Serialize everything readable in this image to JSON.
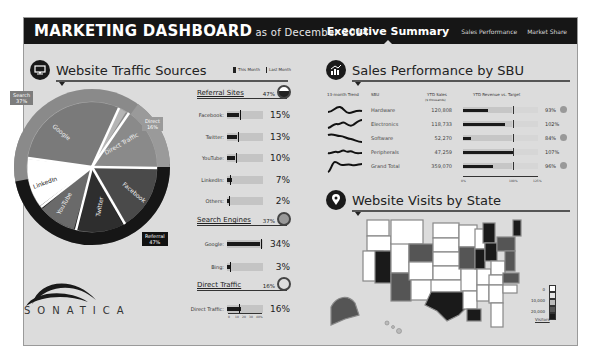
{
  "header": {
    "title": "MARKETING DASHBOARD",
    "subtitle": "as of December 2014",
    "tabs": [
      {
        "label": "Executive Summary",
        "active": true
      },
      {
        "label": "Sales Performance",
        "active": false
      },
      {
        "label": "Market Share",
        "active": false
      }
    ]
  },
  "traffic": {
    "title": "Website Traffic Sources",
    "icon": "monitor-icon",
    "legend": {
      "this_month": "This Month",
      "last_month": "Last Month"
    },
    "pie_labels": {
      "search": "Search\n37%",
      "direct": "Direct\n16%",
      "referral": "Referral\n47%"
    },
    "pie_slices": [
      {
        "name": "Google",
        "value": 34,
        "group": "Search",
        "color": "#7a7a7a"
      },
      {
        "name": "Bing",
        "value": 3,
        "group": "Search",
        "color": "#8c8c8c"
      },
      {
        "name": "Direct Traffic",
        "value": 16,
        "group": "Direct",
        "color": "#8a8a8a"
      },
      {
        "name": "Facebook",
        "value": 15,
        "group": "Referral",
        "color": "#4a4a4a"
      },
      {
        "name": "Twitter",
        "value": 13,
        "group": "Referral",
        "color": "#2e2e2e"
      },
      {
        "name": "YouTube",
        "value": 10,
        "group": "Referral",
        "color": "#6a6a6a"
      },
      {
        "name": "LinkedIn",
        "value": 7,
        "group": "Referral",
        "color": "#ffffff"
      },
      {
        "name": "Others",
        "value": 2,
        "group": "Referral",
        "color": "#ffffff"
      }
    ],
    "groups": [
      {
        "name": "Referral Sites",
        "pct": "47%",
        "rows": [
          {
            "label": "Facebook:",
            "value": "15%",
            "this": 15,
            "last": 18
          },
          {
            "label": "Twitter:",
            "value": "13%",
            "this": 13,
            "last": 14
          },
          {
            "label": "YouTube:",
            "value": "10%",
            "this": 10,
            "last": 12
          },
          {
            "label": "LinkedIn:",
            "value": "7%",
            "this": 7,
            "last": 5
          },
          {
            "label": "Others:",
            "value": "2%",
            "this": 2,
            "last": 3
          }
        ]
      },
      {
        "name": "Search Engines",
        "pct": "37%",
        "rows": [
          {
            "label": "Google:",
            "value": "34%",
            "this": 34,
            "last": 35
          },
          {
            "label": "Bing:",
            "value": "3%",
            "this": 3,
            "last": 3
          }
        ]
      },
      {
        "name": "Direct Traffic",
        "pct": "16%",
        "rows": [
          {
            "label": "Direct Traffic:",
            "value": "16%",
            "this": 16,
            "last": 14
          }
        ]
      }
    ],
    "scale_ticks": [
      "0",
      "10",
      "20",
      "30",
      "40%"
    ]
  },
  "logo": {
    "text": "SONATICA"
  },
  "sales": {
    "title": "Sales Performance by SBU",
    "icon": "chart-icon",
    "headers": {
      "trend": "13-month Trend",
      "sbu": "SBU",
      "ytd_sales": "YTD Sales",
      "ytd_sales_unit": "($ thousands)",
      "revenue_vs_target": "YTD Revenue vs. Target"
    },
    "rows": [
      {
        "sbu": "Hardware",
        "sales": "120,808",
        "pct": "93%",
        "bar": 33,
        "status": true
      },
      {
        "sbu": "Electronics",
        "sales": "118,733",
        "pct": "102%",
        "bar": 57,
        "status": false
      },
      {
        "sbu": "Software",
        "sales": "52,270",
        "pct": "84%",
        "bar": 10,
        "status": true
      },
      {
        "sbu": "Peripherals",
        "sales": "47,259",
        "pct": "107%",
        "bar": 68,
        "status": false
      },
      {
        "sbu": "Grand Total",
        "sales": "359,070",
        "pct": "96%",
        "bar": 40,
        "status": true
      }
    ],
    "axis": [
      "0%",
      "100%",
      "125%"
    ]
  },
  "visits": {
    "title": "Website Visits by State",
    "icon": "map-pin-icon",
    "legend": {
      "v0": "0",
      "v1": "10,000",
      "v2": "20,000",
      "caption": "Visitors"
    }
  }
}
